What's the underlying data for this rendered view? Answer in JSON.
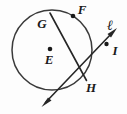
{
  "figure": {
    "kind": "geometry-diagram",
    "background_color": "#fdfdfd",
    "stroke_color": "#1a1a1a",
    "label_color": "#1a1a1a",
    "circle": {
      "name": "circle-E",
      "center_x": 52,
      "center_y": 50,
      "radius": 40,
      "stroke_width": 1.4
    },
    "points": [
      {
        "id": "E",
        "label": "E",
        "x": 50,
        "y": 49,
        "label_x": 49,
        "label_y": 62,
        "dot": true,
        "role": "center"
      },
      {
        "id": "F",
        "label": "F",
        "x": 73,
        "y": 16,
        "label_x": 81,
        "label_y": 13,
        "dot": true,
        "role": "on-circle"
      },
      {
        "id": "G",
        "label": "G",
        "x": 50,
        "y": 13,
        "label_x": 42,
        "label_y": 26,
        "dot": false,
        "role": "on-circle"
      },
      {
        "id": "H",
        "label": "H",
        "x": 84,
        "y": 77,
        "label_x": 89,
        "label_y": 90,
        "dot": false,
        "role": "intersection"
      },
      {
        "id": "I",
        "label": "I",
        "x": 107,
        "y": 44,
        "label_x": 114,
        "label_y": 54,
        "dot": true,
        "role": "on-line"
      }
    ],
    "segments": [
      {
        "id": "chord-GH",
        "label": "chord GH",
        "x1": 50,
        "y1": 13,
        "x2": 86,
        "y2": 80,
        "stroke_width": 1.5,
        "arrow_start": false,
        "arrow_end": false
      }
    ],
    "lines": [
      {
        "id": "line-l",
        "label": "ℓ",
        "label_x": 110,
        "label_y": 30,
        "x1": 42,
        "y1": 106,
        "x2": 116,
        "y2": 29,
        "stroke_width": 1.5,
        "arrow_start": true,
        "arrow_end": true
      }
    ],
    "labels": [
      {
        "id": "label-E",
        "text": "E"
      },
      {
        "id": "label-F",
        "text": "F"
      },
      {
        "id": "label-G",
        "text": "G"
      },
      {
        "id": "label-H",
        "text": "H"
      },
      {
        "id": "label-I",
        "text": "I"
      },
      {
        "id": "label-l",
        "text": "ℓ"
      }
    ]
  }
}
